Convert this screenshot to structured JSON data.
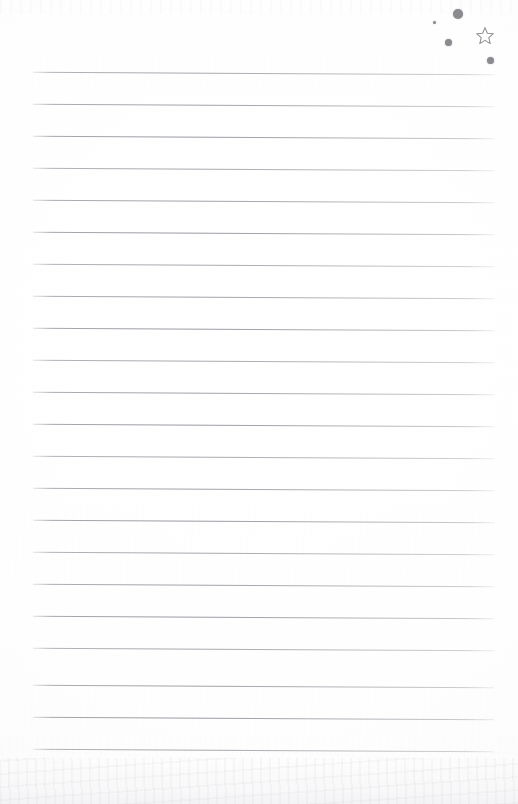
{
  "page": {
    "kind": "scanned-lined-paper",
    "width": 518,
    "height": 804,
    "paper_color": "#fefefe",
    "texture_color": "#f4f4f6",
    "written_text": "",
    "caption": ""
  },
  "ruled_lines": {
    "count": 22,
    "color": "#80828a",
    "thickness_px": 1,
    "left_x": 33,
    "right_x": 494,
    "first_y": 73,
    "spacing_y": 32,
    "y_positions": [
      73,
      105,
      137,
      169,
      201,
      233,
      265,
      297,
      329,
      361,
      393,
      425,
      457,
      489,
      521,
      553,
      585,
      617,
      649,
      686,
      718,
      750
    ]
  },
  "marks": {
    "label": "hand-drawn marks in upper right corner",
    "ink_color": "#8b8b8f",
    "dots": [
      {
        "name": "dot-large",
        "x": 458,
        "y": 14,
        "size": 10
      },
      {
        "name": "dot-tiny",
        "x": 434,
        "y": 22,
        "size": 3
      },
      {
        "name": "dot-medium",
        "x": 448,
        "y": 42,
        "size": 7
      },
      {
        "name": "dot-small",
        "x": 490,
        "y": 60,
        "size": 7
      }
    ],
    "star": {
      "name": "star-outline",
      "x": 475,
      "y": 26,
      "size": 18,
      "points": 5,
      "filled": false,
      "stroke_color": "#8e8e93"
    }
  }
}
